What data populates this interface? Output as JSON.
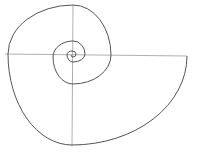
{
  "diagram": {
    "type": "logarithmic-spiral",
    "background": "#ffffff",
    "spiral_color": "#555555",
    "axis_color": "#9a9a9a",
    "spiral_width": 1,
    "axis_width": 0.8,
    "horizontal_axis": {
      "x1": 5,
      "y1": 54,
      "x2": 187,
      "y2": 56
    },
    "vertical_axis": {
      "x1": 73,
      "y1": 5,
      "x2": 72,
      "y2": 146
    },
    "spiral_points": [
      [
        187,
        56
      ],
      [
        72,
        145
      ],
      [
        8,
        54
      ],
      [
        73,
        5
      ],
      [
        111,
        55
      ],
      [
        73,
        84
      ],
      [
        53,
        57
      ],
      [
        73,
        41
      ],
      [
        85,
        54
      ],
      [
        73,
        62
      ],
      [
        67,
        55
      ],
      [
        72,
        51
      ],
      [
        76,
        54
      ],
      [
        73,
        57
      ],
      [
        71,
        55
      ]
    ]
  }
}
